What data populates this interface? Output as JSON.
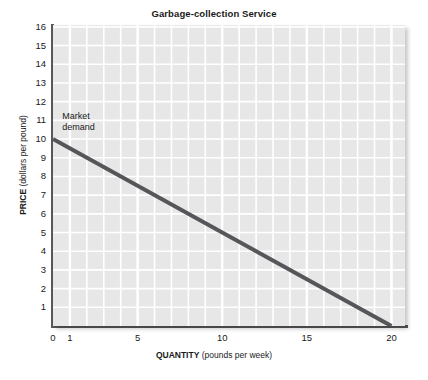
{
  "chart_data": {
    "type": "line",
    "title": "Garbage-collection Service",
    "xlabel_strong": "QUANTITY",
    "xlabel_rest": " (pounds per week)",
    "ylabel_strong": "PRICE",
    "ylabel_rest": " (dollars per pound)",
    "xlim": [
      0,
      20.8
    ],
    "ylim": [
      0,
      16.1
    ],
    "grid": true,
    "grid_color": "#ffffff",
    "plot_background": "#e7e7e7",
    "legend_position": "inline-annotation",
    "xticks": [
      0,
      1,
      5,
      10,
      15,
      20
    ],
    "xtick_labels": [
      "0",
      "1",
      "5",
      "10",
      "15",
      "20"
    ],
    "yticks": [
      1,
      2,
      3,
      4,
      5,
      6,
      7,
      8,
      9,
      10,
      11,
      12,
      13,
      14,
      15,
      16
    ],
    "ytick_labels": [
      "1",
      "2",
      "3",
      "4",
      "5",
      "6",
      "7",
      "8",
      "9",
      "10",
      "11",
      "12",
      "13",
      "14",
      "15",
      "16"
    ],
    "x_minor_step": 1,
    "y_minor_step": 1,
    "series": [
      {
        "name": "Market demand",
        "color": "#55555a",
        "line_width": 4,
        "annotation": "Market\ndemand",
        "annotation_x": 0.55,
        "annotation_y": 11.2,
        "points": [
          {
            "x": 0,
            "y": 10
          },
          {
            "x": 20,
            "y": 0
          }
        ],
        "intercept": 10,
        "slope": -0.5,
        "table": {
          "columns": [
            "Quantity (pounds per week)",
            "Price (dollars per pound)"
          ],
          "rows": [
            [
              "0",
              "10"
            ],
            [
              "1",
              "9.5"
            ],
            [
              "5",
              "7.5"
            ],
            [
              "10",
              "5"
            ],
            [
              "15",
              "2.5"
            ],
            [
              "20",
              "0"
            ]
          ]
        }
      }
    ]
  }
}
